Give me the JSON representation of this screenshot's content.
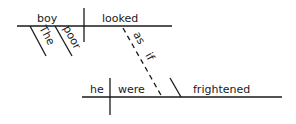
{
  "diagram": {
    "type": "sentence-diagram",
    "sentence": "The poor boy looked as if he were frightened",
    "main_clause": {
      "subject": "boy",
      "verb": "looked",
      "modifiers": [
        "The",
        "poor"
      ]
    },
    "connector": [
      "as",
      "if"
    ],
    "sub_clause": {
      "subject": "he",
      "verb": "were",
      "complement": "frightened"
    },
    "line_color": "#1a1a1a"
  }
}
